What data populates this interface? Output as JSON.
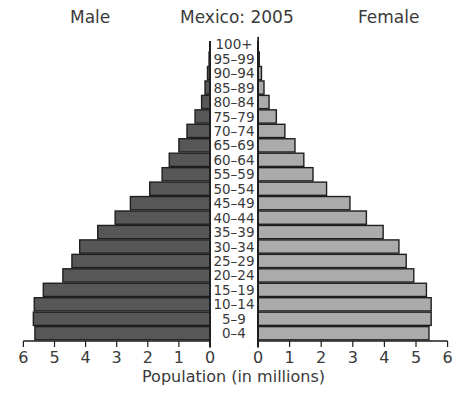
{
  "chart_data": {
    "type": "bar",
    "subtype": "population-pyramid",
    "title": "Mexico: 2005",
    "xlabel": "Population (in millions)",
    "ylabel": "",
    "left_label": "Male",
    "right_label": "Female",
    "xlim": [
      0,
      6
    ],
    "xticks": [
      0,
      1,
      2,
      3,
      4,
      5,
      6
    ],
    "grid": false,
    "legend": "none",
    "categories": [
      "100+",
      "95–99",
      "90–94",
      "85–89",
      "80–84",
      "75–79",
      "70–74",
      "65–69",
      "60–64",
      "55–59",
      "50–54",
      "45–49",
      "40–44",
      "35–39",
      "30–34",
      "25–29",
      "20–24",
      "15–19",
      "10–14",
      "5–9",
      "0–4"
    ],
    "series": [
      {
        "name": "Male",
        "color": "#575757",
        "values": [
          0.0,
          0.03,
          0.08,
          0.16,
          0.27,
          0.48,
          0.74,
          1.0,
          1.31,
          1.54,
          1.94,
          2.56,
          3.05,
          3.61,
          4.19,
          4.44,
          4.73,
          5.36,
          5.65,
          5.68,
          5.63
        ]
      },
      {
        "name": "Female",
        "color": "#ababab",
        "values": [
          0.01,
          0.04,
          0.11,
          0.19,
          0.35,
          0.58,
          0.85,
          1.17,
          1.45,
          1.74,
          2.17,
          2.91,
          3.43,
          3.96,
          4.46,
          4.69,
          4.93,
          5.33,
          5.48,
          5.48,
          5.41
        ]
      }
    ]
  },
  "header": {
    "male": "Male",
    "title": "Mexico: 2005",
    "female": "Female"
  },
  "axis": {
    "xlabel": "Population (in millions)"
  },
  "colors": {
    "male_bar": "#575757",
    "female_bar": "#ababab",
    "outline": "#1e1e1e",
    "text": "#3a3a3a"
  }
}
